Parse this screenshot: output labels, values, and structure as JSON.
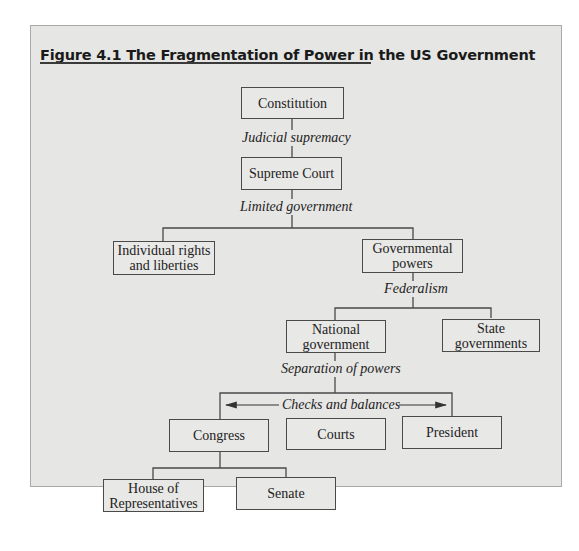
{
  "figure": {
    "title": "Figure 4.1  The Fragmentation of Power in the US Government"
  },
  "nodes": {
    "constitution": "Constitution",
    "supreme_court": "Supreme Court",
    "individual_rights": [
      "Individual rights",
      "and liberties"
    ],
    "governmental_powers": [
      "Governmental",
      "powers"
    ],
    "national_government": [
      "National",
      "government"
    ],
    "state_governments": [
      "State",
      "governments"
    ],
    "congress": "Congress",
    "courts": "Courts",
    "president": "President",
    "house": [
      "House of",
      "Representatives"
    ],
    "senate": "Senate"
  },
  "edge_labels": {
    "judicial_supremacy": "Judicial supremacy",
    "limited_government": "Limited government",
    "federalism": "Federalism",
    "separation_of_powers": "Separation of powers",
    "checks_and_balances": "Checks and balances"
  },
  "colors": {
    "panel_background": "#e6e6e4",
    "line": "#4a4a4a"
  }
}
